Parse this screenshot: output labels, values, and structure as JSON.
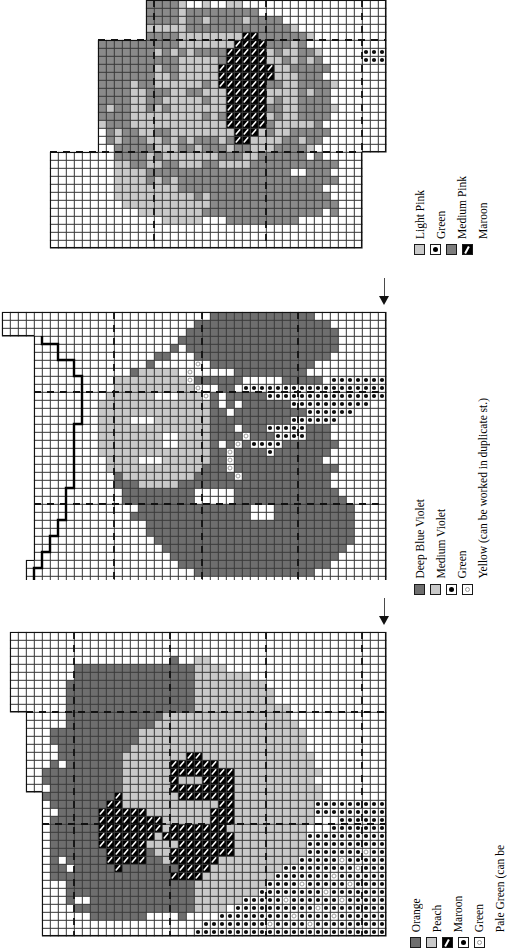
{
  "document": {
    "title": "Cross-Stitch Pattern Charts",
    "type": "needlework-chart-sheet",
    "chart_count": 3,
    "orientation": "legends rotated 90 degrees counter-clockwise"
  },
  "charts": [
    {
      "id": "chart-top",
      "name": "Pink Floral Motif",
      "center_arrow": false,
      "legend": {
        "items": [
          {
            "label": "Light Pink",
            "symbol": "solid-light-gray",
            "color": "#c9c9c9"
          },
          {
            "label": "Green",
            "symbol": "white-black-dot",
            "color": "#ffffff"
          },
          {
            "label": "Medium Pink",
            "symbol": "solid-mid-gray",
            "color": "#7d7d7d"
          },
          {
            "label": "Maroon",
            "symbol": "black-diagonal",
            "color": "#000000"
          }
        ]
      }
    },
    {
      "id": "chart-middle",
      "name": "Violet Floral Motif",
      "center_arrow": true,
      "legend": {
        "items": [
          {
            "label": "Deep Blue Violet",
            "symbol": "solid-dark-gray",
            "color": "#6e6e6e"
          },
          {
            "label": "Medium Violet",
            "symbol": "solid-light-gray",
            "color": "#c9c9c9"
          },
          {
            "label": "Green",
            "symbol": "white-black-dot",
            "color": "#ffffff"
          },
          {
            "label": "Yellow (can be worked in duplicate st.)",
            "symbol": "white-pale-dot",
            "color": "#ffffff"
          }
        ]
      }
    },
    {
      "id": "chart-bottom",
      "name": "Orange Floral Motif",
      "center_arrow": true,
      "legend": {
        "items": [
          {
            "label": "Orange",
            "symbol": "solid-dark-gray",
            "color": "#6e6e6e"
          },
          {
            "label": "Peach",
            "symbol": "solid-light-gray",
            "color": "#c9c9c9"
          },
          {
            "label": "Maroon",
            "symbol": "black-diagonal",
            "color": "#000000"
          },
          {
            "label": "Green",
            "symbol": "white-black-dot",
            "color": "#ffffff"
          },
          {
            "label": "Pale Green (can be",
            "symbol": "white-pale-dot",
            "color": "#ffffff"
          }
        ]
      }
    }
  ],
  "chart_data": {
    "type": "heatmap",
    "grid_cell_px": 8,
    "palette": {
      "empty": "#ffffff",
      "light": "#c9c9c9",
      "mid": "#8a8a8a",
      "dark": "#6e6e6e",
      "black": "#000000",
      "gridline": "#3c3c3c",
      "dashline": "#111111"
    },
    "charts": [
      {
        "name": "Pink Floral Motif",
        "cols": 48,
        "rows": 31,
        "origin": [
          4,
          -1
        ],
        "legend": [
          "Light Pink",
          "Green",
          "Medium Pink",
          "Maroon"
        ]
      },
      {
        "name": "Violet Floral Motif",
        "cols": 48,
        "rows": 34,
        "origin": [
          2,
          310
        ],
        "legend": [
          "Deep Blue Violet",
          "Medium Violet",
          "Green",
          "Yellow (can be worked in duplicate st.)"
        ]
      },
      {
        "name": "Orange Floral Motif",
        "cols": 48,
        "rows": 38,
        "origin": [
          2,
          630
        ],
        "legend": [
          "Orange",
          "Peach",
          "Maroon",
          "Green",
          "Pale Green (can be"
        ]
      }
    ]
  }
}
